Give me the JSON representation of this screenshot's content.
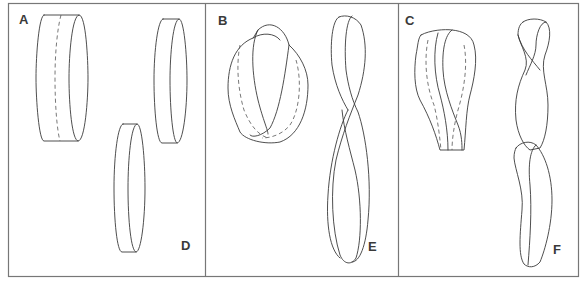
{
  "figure": {
    "panels": [
      {
        "id": "A",
        "label": "A",
        "description": "Cylinder band with dashed center cut line"
      },
      {
        "id": "D",
        "label": "D",
        "description": "Two separate narrower bands resulting from cutting A"
      },
      {
        "id": "B",
        "label": "B",
        "description": "Moebius strip (one half-twist) with dashed center cut line"
      },
      {
        "id": "E",
        "label": "E",
        "description": "Single long band with two half-twists resulting from cutting B"
      },
      {
        "id": "C",
        "label": "C",
        "description": "Strip with two half-twists and dashed center cut line"
      },
      {
        "id": "F",
        "label": "F",
        "description": "Two interlinked twisted bands resulting from cutting C"
      }
    ],
    "colors": {
      "line": "#3a3a3a",
      "frame": "#777777",
      "background": "#ffffff"
    }
  }
}
